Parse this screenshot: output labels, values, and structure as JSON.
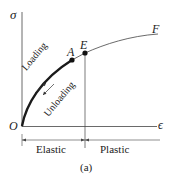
{
  "diagram": {
    "type": "stress-strain curve",
    "axes": {
      "y_label": "σ",
      "x_label": "ϵ",
      "origin_label": "O"
    },
    "points": [
      {
        "label": "A"
      },
      {
        "label": "E"
      },
      {
        "label": "F"
      }
    ],
    "curve_labels": {
      "loading": "Loading",
      "unloading": "Unloading"
    },
    "regions": {
      "elastic": "Elastic",
      "plastic": "Plastic"
    },
    "caption": "(a)",
    "colors": {
      "line": "#333333",
      "curve_bold": "#1a1a1a"
    }
  }
}
